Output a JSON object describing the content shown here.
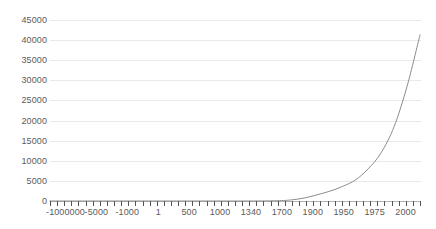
{
  "chart_data": {
    "type": "line",
    "title": "",
    "subtitle": "",
    "xlabel": "",
    "ylabel": "",
    "grid": true,
    "legend": false,
    "ylim": [
      0,
      45000
    ],
    "ytick_labels": [
      "45000",
      "40000",
      "35000",
      "30000",
      "25000",
      "20000",
      "15000",
      "10000",
      "5000",
      "0"
    ],
    "ytick_values": [
      45000,
      40000,
      35000,
      30000,
      25000,
      20000,
      15000,
      10000,
      5000,
      0
    ],
    "xtick_labels": [
      "-1000000",
      "-5000",
      "-1000",
      "1",
      "500",
      "1000",
      "1340",
      "1700",
      "1900",
      "1950",
      "1975",
      "2000"
    ],
    "x_axis_type": "category",
    "n_category_ticks": 53,
    "series": [
      {
        "name": "value",
        "color": "#8c8c8c",
        "line_width": 1,
        "categories": [
          "-1000000",
          "-5000",
          "-1000",
          "1",
          "500",
          "1000",
          "1340",
          "1700",
          "1900",
          "1950",
          "1975",
          "2000"
        ],
        "values": [
          0,
          0,
          0,
          0,
          0,
          0,
          0,
          100,
          1600,
          5200,
          13500,
          41300
        ]
      }
    ],
    "sampled_points": [
      {
        "x": 0.0,
        "y": 0
      },
      {
        "x": 0.2,
        "y": 0
      },
      {
        "x": 0.4,
        "y": 0
      },
      {
        "x": 0.55,
        "y": 0
      },
      {
        "x": 0.62,
        "y": 80
      },
      {
        "x": 0.655,
        "y": 300
      },
      {
        "x": 0.69,
        "y": 800
      },
      {
        "x": 0.72,
        "y": 1500
      },
      {
        "x": 0.755,
        "y": 2400
      },
      {
        "x": 0.79,
        "y": 3600
      },
      {
        "x": 0.825,
        "y": 5200
      },
      {
        "x": 0.86,
        "y": 8000
      },
      {
        "x": 0.895,
        "y": 12000
      },
      {
        "x": 0.93,
        "y": 18500
      },
      {
        "x": 0.965,
        "y": 28500
      },
      {
        "x": 1.0,
        "y": 41300
      }
    ]
  },
  "colors": {
    "background": "#ffffff",
    "gridline": "#e9e9e9",
    "axis": "#b3b3b3",
    "tick": "#555555",
    "text": "#5a5a5a",
    "series": "#8c8c8c"
  }
}
